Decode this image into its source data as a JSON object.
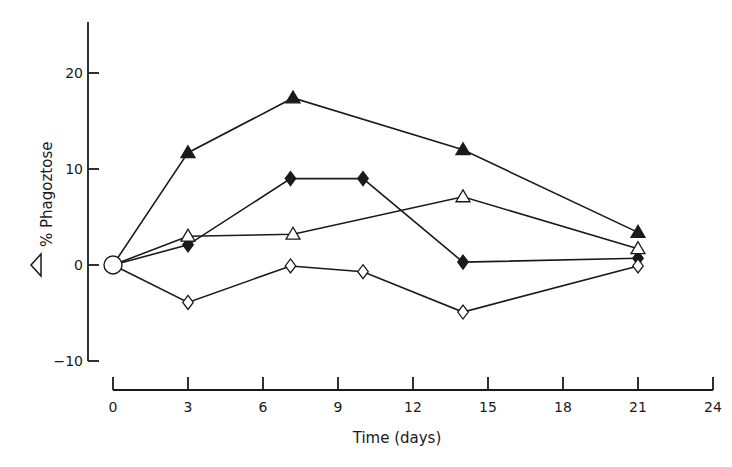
{
  "chart_data": {
    "type": "line",
    "title": "",
    "xlabel": "Time (days)",
    "ylabel": "△ % Phagoztose",
    "ylabel_symbol": "△",
    "ylabel_text": "% Phagoztose",
    "xlim": [
      0,
      24
    ],
    "ylim": [
      -10,
      25
    ],
    "x_ticks": [
      0,
      3,
      6,
      9,
      12,
      15,
      18,
      21,
      24
    ],
    "y_ticks": [
      -10,
      0,
      10,
      20
    ],
    "grid": false,
    "legend": "none",
    "origin_marker": {
      "shape": "open-circle",
      "x": 0,
      "y": 0
    },
    "series": [
      {
        "name": "filled-triangle",
        "marker": "triangle",
        "filled": true,
        "x": [
          0,
          3,
          7.2,
          14,
          21
        ],
        "y": [
          0,
          11.7,
          17.4,
          12.0,
          3.4
        ]
      },
      {
        "name": "filled-diamond",
        "marker": "diamond",
        "filled": true,
        "x": [
          0,
          3,
          7.1,
          10,
          14,
          21
        ],
        "y": [
          0,
          2.1,
          9.0,
          9.0,
          0.3,
          0.7
        ]
      },
      {
        "name": "open-triangle",
        "marker": "triangle",
        "filled": false,
        "x": [
          0,
          3,
          7.2,
          14,
          21
        ],
        "y": [
          0,
          3.0,
          3.2,
          7.1,
          1.7
        ]
      },
      {
        "name": "open-diamond",
        "marker": "diamond",
        "filled": false,
        "x": [
          0,
          3,
          7.1,
          10,
          14,
          21
        ],
        "y": [
          0,
          -3.9,
          -0.1,
          -0.7,
          -4.9,
          -0.1
        ]
      }
    ]
  },
  "colors": {
    "ink": "#1a1a1a",
    "background": "#ffffff"
  }
}
